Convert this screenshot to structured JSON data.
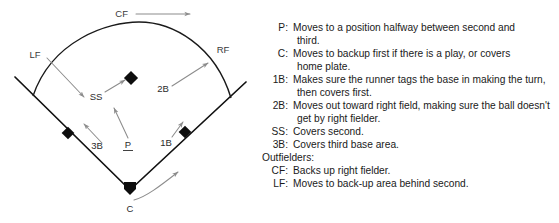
{
  "diagram": {
    "outfield_labels": [
      {
        "id": "CF",
        "text": "CF"
      },
      {
        "id": "LF",
        "text": "LF"
      },
      {
        "id": "RF",
        "text": "RF"
      }
    ],
    "infield_labels": [
      {
        "id": "SS",
        "text": "SS"
      },
      {
        "id": "2B",
        "text": "2B"
      },
      {
        "id": "3B",
        "text": "3B"
      },
      {
        "id": "1B",
        "text": "1B"
      },
      {
        "id": "P",
        "text": "P"
      },
      {
        "id": "C",
        "text": "C"
      }
    ],
    "colors": {
      "foul_line": "#111111",
      "outfield_arc": "#1a1a1a",
      "movement_arrow": "#8c8c8c",
      "base": "#0d0d0d",
      "label": "#3a3a3a",
      "background": "#ffffff"
    }
  },
  "assignments": [
    {
      "tag": "P:",
      "lines": [
        "Moves to a position halfway between second and",
        "third."
      ]
    },
    {
      "tag": "C:",
      "lines": [
        "Moves to backup first if there is a play, or covers",
        "home plate."
      ]
    },
    {
      "tag": "1B:",
      "lines": [
        "Makes sure the runner tags the base in making the turn,",
        "then covers first."
      ]
    },
    {
      "tag": "2B:",
      "lines": [
        "Moves out toward right field, making sure the ball doesn't",
        "get by right fielder."
      ]
    },
    {
      "tag": "SS:",
      "lines": [
        "Covers second."
      ]
    },
    {
      "tag": "3B:",
      "lines": [
        "Covers third base area."
      ]
    },
    {
      "tag": "Outfielders:",
      "lines": [],
      "section": true
    },
    {
      "tag": "CF:",
      "lines": [
        "Backs up right fielder."
      ]
    },
    {
      "tag": "LF:",
      "lines": [
        "Moves to back-up area behind second."
      ]
    }
  ]
}
